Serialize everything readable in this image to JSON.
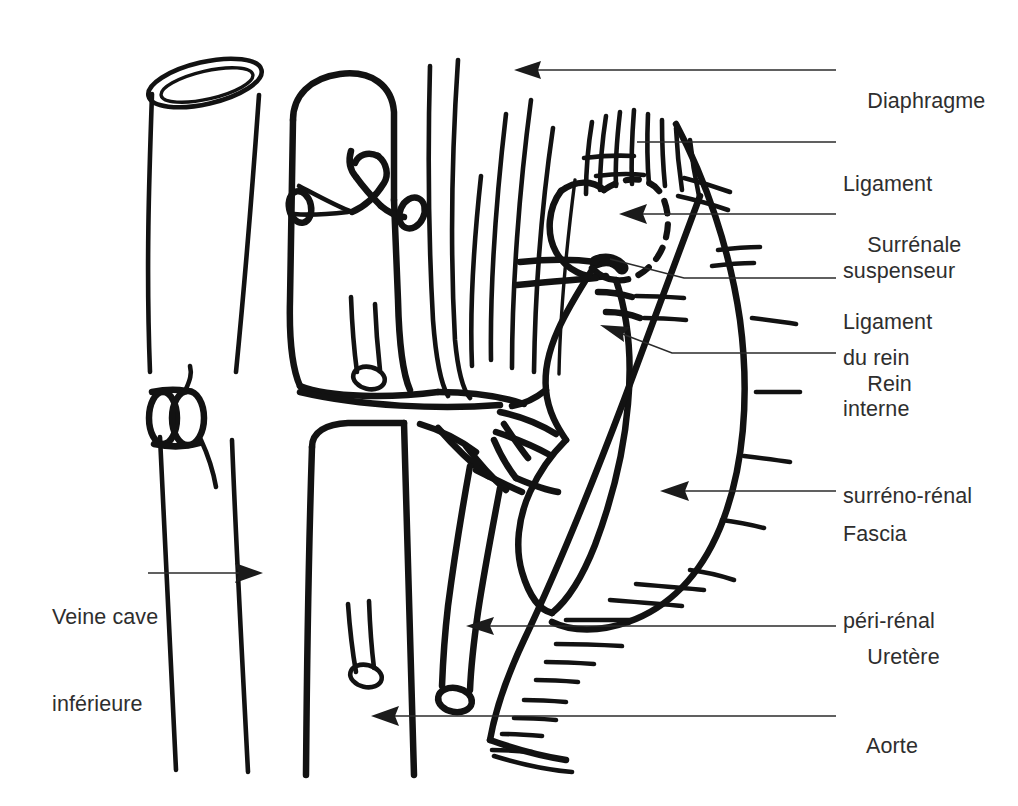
{
  "figure": {
    "type": "anatomical-line-diagram",
    "language": "fr",
    "ink_color": "#121212",
    "background_color": "#ffffff",
    "leader_color": "#2b2b2b"
  },
  "labels": {
    "right": [
      {
        "id": "diaphragme",
        "text": "Diaphragme",
        "lines": [
          "Diaphragme"
        ],
        "x": 843,
        "y": 58,
        "leader": {
          "style": "straight-arrow",
          "from_x": 836,
          "from_y": 70,
          "to_x": 516,
          "to_y": 70
        }
      },
      {
        "id": "ligament-suspenseur-du-rein",
        "text": "Ligament suspenseur du rein",
        "lines": [
          "Ligament",
          "suspenseur",
          "du rein"
        ],
        "x": 843,
        "y": 112,
        "leader": {
          "style": "plain-line",
          "from_x": 836,
          "from_y": 142,
          "to_x": 637,
          "to_y": 142
        }
      },
      {
        "id": "surrenale",
        "text": "Surrénale",
        "lines": [
          "Surrénale"
        ],
        "x": 843,
        "y": 202,
        "leader": {
          "style": "straight-arrow",
          "from_x": 836,
          "from_y": 214,
          "to_x": 621,
          "to_y": 214
        }
      },
      {
        "id": "ligament-interne-surreno-renal",
        "text": "Ligament interne surréno-rénal",
        "lines": [
          "Ligament",
          "interne",
          "surréno-rénal"
        ],
        "x": 843,
        "y": 250,
        "leader": {
          "style": "bent-line",
          "from_x": 836,
          "from_y": 278,
          "bend_x": 684,
          "bend_y": 278,
          "to_x": 610,
          "to_y": 259
        }
      },
      {
        "id": "rein",
        "text": "Rein",
        "lines": [
          "Rein"
        ],
        "x": 843,
        "y": 341,
        "leader": {
          "style": "bent-arrow",
          "from_x": 836,
          "from_y": 353,
          "bend_x": 672,
          "bend_y": 353,
          "to_x": 601,
          "to_y": 325
        }
      },
      {
        "id": "fascia-peri-renal",
        "text": "Fascia péri-rénal",
        "lines": [
          "Fascia",
          "péri-rénal"
        ],
        "x": 843,
        "y": 462,
        "leader": {
          "style": "straight-arrow",
          "from_x": 836,
          "from_y": 491,
          "to_x": 662,
          "to_y": 491
        }
      },
      {
        "id": "uretere",
        "text": "Uretère",
        "lines": [
          "Uretère"
        ],
        "x": 843,
        "y": 614,
        "leader": {
          "style": "straight-arrow",
          "from_x": 836,
          "from_y": 626,
          "to_x": 467,
          "to_y": 626
        }
      },
      {
        "id": "aorte",
        "text": "Aorte",
        "lines": [
          "Aorte"
        ],
        "x": 843,
        "y": 703,
        "leader": {
          "style": "straight-arrow",
          "from_x": 836,
          "from_y": 716,
          "to_x": 372,
          "to_y": 716
        }
      }
    ],
    "left": [
      {
        "id": "veine-cave-inferieure",
        "text": "Veine cave inférieure",
        "lines": [
          "Veine cave",
          "inférieure"
        ],
        "x": 52,
        "y": 545,
        "leader": {
          "style": "straight-arrow-right",
          "from_x": 148,
          "from_y": 573,
          "to_x": 262,
          "to_y": 573
        }
      }
    ]
  },
  "structures": [
    {
      "id": "veine-cave-inferieure",
      "name": "Veine cave inférieure",
      "note": "tube vertical gauche à section ouverte en ellipse"
    },
    {
      "id": "aorte",
      "name": "Aorte",
      "note": "tronc vertical central avec branches coupées"
    },
    {
      "id": "diaphragme",
      "name": "Diaphragme",
      "note": "fibres verticales en haut à droite"
    },
    {
      "id": "surrenale",
      "name": "Surrénale",
      "note": "contour en tirets"
    },
    {
      "id": "rein",
      "name": "Rein",
      "note": "organe réniforme central droit"
    },
    {
      "id": "uretere",
      "name": "Uretère",
      "note": "tube descendant depuis le bassinet"
    },
    {
      "id": "fascia-peri-renal",
      "name": "Fascia péri-rénal",
      "note": "enveloppe hachurée entourant le rein"
    },
    {
      "id": "ligament-suspenseur-du-rein",
      "name": "Ligament suspenseur du rein",
      "note": "hachures au pôle supérieur"
    },
    {
      "id": "ligament-interne-surreno-renal",
      "name": "Ligament interne surréno-rénal",
      "note": "épaississement entre surrénale et rein"
    }
  ]
}
